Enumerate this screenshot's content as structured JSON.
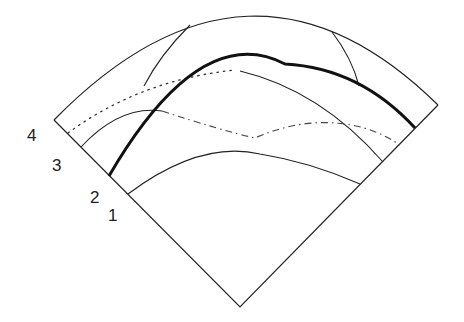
{
  "diagram": {
    "type": "wavefront-sector-diagram",
    "colors": {
      "line": "#222222",
      "background": "#ffffff"
    },
    "labels": [
      {
        "id": "4",
        "text": "4",
        "x": 27,
        "y": 127
      },
      {
        "id": "3",
        "text": "3",
        "x": 52,
        "y": 157
      },
      {
        "id": "2",
        "text": "2",
        "x": 90,
        "y": 189
      },
      {
        "id": "1",
        "text": "1",
        "x": 108,
        "y": 207
      }
    ],
    "paths": {
      "sector_outline": {
        "style": "solid",
        "d": "M54,120 L240,307 L438,105"
      },
      "outer_arc": {
        "style": "solid",
        "d": "M54,120 Q250,-80 438,105"
      },
      "upper_left_segment": {
        "style": "solid",
        "d": "M190,25 Q160,55 144,86"
      },
      "upper_right_segment": {
        "style": "solid",
        "d": "M332,32 Q352,58 359,86"
      },
      "dotted_curve": {
        "style": "dotted",
        "d": "M68,133 Q140,80 235,70"
      },
      "thick_curve": {
        "style": "thick",
        "d": "M109,176 Q200,20 285,64 Q360,68 415,128"
      },
      "thin_arc_upper": {
        "style": "solid",
        "d": "M81,147 Q120,105 162,111"
      },
      "thin_arc_right": {
        "style": "solid",
        "d": "M240,71 Q320,90 383,162"
      },
      "dash_dot_curve": {
        "style": "dashdot",
        "d": "M162,111 Q220,130 255,138 Q300,118 345,124 Q375,128 400,145"
      },
      "lowest_arc": {
        "style": "solid",
        "d": "M128,194 Q200,140 260,154 Q310,162 360,184"
      }
    }
  }
}
